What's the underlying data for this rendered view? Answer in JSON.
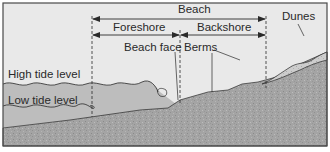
{
  "diagram": {
    "labels": {
      "beach": "Beach",
      "foreshore": "Foreshore",
      "backshore": "Backshore",
      "dunes": "Dunes",
      "beach_face": "Beach face",
      "berms": "Berms",
      "high_tide": "High tide level",
      "low_tide": "Low tide level"
    },
    "colors": {
      "sky": "#e9e9e9",
      "water": "#bdbdbd",
      "ground": "#a4a4a4",
      "dune": "#cfcfcf",
      "border": "#4a4a4a",
      "line": "#2a2a2a"
    }
  }
}
